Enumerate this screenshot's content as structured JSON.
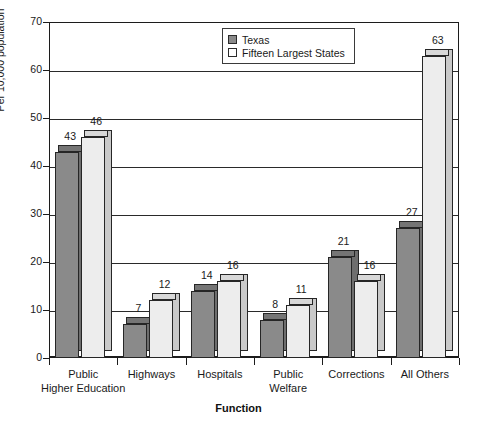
{
  "chart_data": {
    "type": "bar",
    "title": "",
    "subtitle": "",
    "xlabel": "Function",
    "ylabel": "Per 10,000 population",
    "ylim": [
      0,
      70
    ],
    "ytick_step": 10,
    "yticks": [
      "0",
      "10",
      "20",
      "30",
      "40",
      "50",
      "60",
      "70"
    ],
    "grid": "horizontal",
    "legend_position": "top-center-right",
    "categories": [
      "Public Higher Education",
      "Highways",
      "Hospitals",
      "Public Welfare",
      "Corrections",
      "All Others"
    ],
    "category_lines": [
      [
        "Public",
        "Higher Education"
      ],
      [
        "Highways"
      ],
      [
        "Hospitals"
      ],
      [
        "Public",
        "Welfare"
      ],
      [
        "Corrections"
      ],
      [
        "All Others"
      ]
    ],
    "series": [
      {
        "name": "Texas",
        "color": "#8a8a8a",
        "values": [
          43,
          7,
          14,
          8,
          21,
          27
        ]
      },
      {
        "name": "Fifteen Largest States",
        "color": "#ededed",
        "values": [
          46,
          12,
          16,
          11,
          16,
          63
        ]
      }
    ]
  },
  "legend": {
    "items": [
      {
        "label": "Texas",
        "swatch": "tx"
      },
      {
        "label": "Fifteen Largest States",
        "swatch": "fl"
      }
    ]
  },
  "colors": {
    "texas_fill": "#8a8a8a",
    "fifteen_states_fill": "#ededed",
    "axis": "#1c1c1c",
    "gridline": "#2a2a2a",
    "background": "#ffffff"
  }
}
